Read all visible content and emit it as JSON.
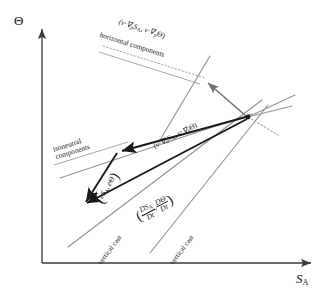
{
  "figure": {
    "domain": "diagram",
    "background": "#ffffff",
    "width": 329,
    "height": 297,
    "line_color_primary": "#1a1a1a",
    "line_color_secondary": "#8c8c8c",
    "dotted_color": "#9a9a9a"
  },
  "axes": {
    "y_label": "Θ",
    "y_label_name": "potential-temperature-axis",
    "x_label_main": "S",
    "x_label_sub": "A",
    "x_label_name": "absolute-salinity-axis",
    "origin": {
      "x": 42,
      "y": 263
    },
    "x_end": {
      "x": 318,
      "y": 263
    },
    "y_end": {
      "x": 42,
      "y": 22
    }
  },
  "labels": {
    "horizontal_components": {
      "vector": "(v·∇",
      "vector_sub1": "p",
      "vector_mid": "S",
      "vector_sub2": "A",
      "vector_mid2": ", v·∇",
      "vector_sub3": "p",
      "vector_end": "Θ)",
      "caption": "horizontal components"
    },
    "isoneutral_components": {
      "vector": "(v·∇",
      "vector_sub1": "n",
      "vector_mid": "S",
      "vector_sub2": "A",
      "vector_mid2": ", v·∇",
      "vector_sub3": "n",
      "vector_end": "Θ)",
      "caption_line1": "isoneutral",
      "caption_line2": "components"
    },
    "vertical_cast_vector": {
      "open": "(",
      "e1": "eS",
      "e1_sub": "A",
      "comma": ", ",
      "e2": "eΘ",
      "close": ")"
    },
    "material_derivative": {
      "open": "(",
      "num1": "DS",
      "num1_sub": "A",
      "den1": "Dt",
      "comma": ",",
      "num2": "DΘ",
      "den2": "Dt",
      "close": ")"
    },
    "vertical_cast_left": "vertical cast",
    "vertical_cast_right": "vertical cast"
  },
  "geometry": {
    "convergence_point": {
      "x": 248,
      "y": 117
    },
    "isoneutral_vertex": {
      "x": 117,
      "y": 152
    },
    "cast_vertex": {
      "x": 82,
      "y": 205
    },
    "horizontal_arrow_tip": {
      "x": 204,
      "y": 81
    }
  }
}
